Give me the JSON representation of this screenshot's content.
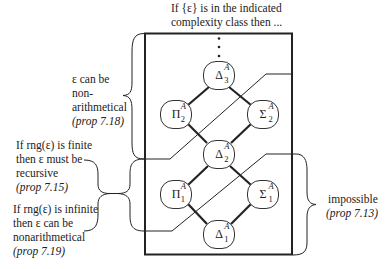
{
  "header": {
    "line1": "If {ε} is in the indicated",
    "line2": "complexity class then ..."
  },
  "annotations": {
    "top_left": {
      "lines": [
        "ε can be",
        "non-",
        "arithmetical"
      ],
      "ref": "(prop 7.18)"
    },
    "finite": {
      "lines": [
        "If rng(ε) is finite",
        "then ε must be",
        "recursive"
      ],
      "ref": "(prop 7.15)"
    },
    "infinite": {
      "lines": [
        "If rng(ε) is infinite",
        "then ε can be",
        "nonarithmetical"
      ],
      "ref": "(prop 7.19)"
    },
    "right": {
      "lines": [
        "impossible"
      ],
      "ref": "(prop 7.13)"
    }
  },
  "nodes": [
    {
      "id": "delta3",
      "symbol": "Δ",
      "sup": "A",
      "sub": "3"
    },
    {
      "id": "pi2",
      "symbol": "Π",
      "sup": "A",
      "sub": "2"
    },
    {
      "id": "sigma2",
      "symbol": "Σ",
      "sup": "A",
      "sub": "2"
    },
    {
      "id": "delta2",
      "symbol": "Δ",
      "sup": "A",
      "sub": "2"
    },
    {
      "id": "pi1",
      "symbol": "Π",
      "sup": "A",
      "sub": "1"
    },
    {
      "id": "sigma1",
      "symbol": "Σ",
      "sup": "A",
      "sub": "1"
    },
    {
      "id": "delta1",
      "symbol": "Δ",
      "sup": "A",
      "sub": "1"
    }
  ],
  "continuation": "⋮"
}
